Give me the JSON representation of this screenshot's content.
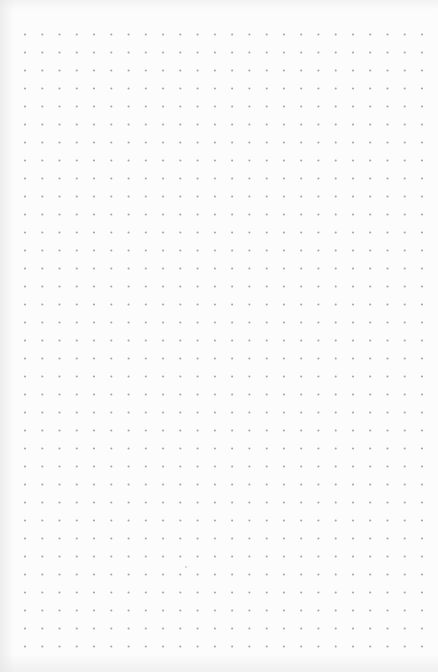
{
  "page": {
    "type": "dot-grid notebook page",
    "background_color": "#fcfcfc",
    "dot_color": "#a6a6a6",
    "columns": 24,
    "rows": 35
  },
  "stray_marks": [
    {
      "name": "faint-mark",
      "color": "#c8c8c8"
    }
  ]
}
